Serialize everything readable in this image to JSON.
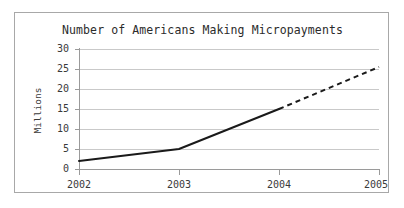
{
  "chart_data": {
    "type": "line",
    "title": "Number of Americans Making Micropayments",
    "xlabel": "",
    "ylabel": "Millions",
    "x": [
      2002,
      2003,
      2004,
      2005
    ],
    "xtick_labels": [
      "2002",
      "2003",
      "2004",
      "2005"
    ],
    "ytick_labels": [
      "0",
      "5",
      "10",
      "15",
      "20",
      "25",
      "30"
    ],
    "ytick_values": [
      0,
      5,
      10,
      15,
      20,
      25,
      30
    ],
    "ylim": [
      0,
      30
    ],
    "xlim": [
      2002,
      2005
    ],
    "grid": "horizontal",
    "legend": "none",
    "series": [
      {
        "name": "Actual",
        "style": "solid",
        "points": [
          {
            "x": 2002,
            "y": 2
          },
          {
            "x": 2003,
            "y": 5
          },
          {
            "x": 2004,
            "y": 15
          }
        ]
      },
      {
        "name": "Projected",
        "style": "dashed",
        "points": [
          {
            "x": 2004,
            "y": 15
          },
          {
            "x": 2005,
            "y": 25.5
          }
        ]
      }
    ],
    "colors": {
      "line": "#1a1a1a",
      "gridline": "#c9c9c9",
      "axis": "#9a9a9a",
      "frame": "#a8a8a8",
      "background": "#ffffff",
      "text": "#3a3a3a"
    }
  }
}
